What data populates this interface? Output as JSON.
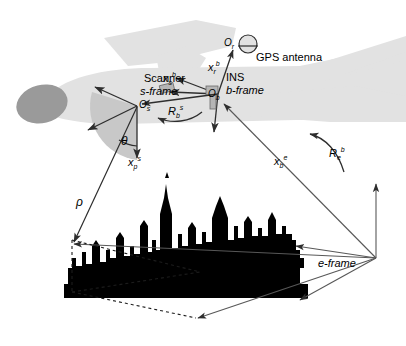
{
  "figure": {
    "background_color": "#ffffff",
    "line_color": "#3a3a3a",
    "text_color": "#000000"
  },
  "aircraft": {
    "body_color": "#e2e2e2",
    "nose_color": "#9a9a9a",
    "name": "aircraft-silhouette"
  },
  "terrain": {
    "skyline_color": "#000000",
    "name": "city-skyline-silhouette"
  },
  "scanner": {
    "wedge_color": "#c8c8c8",
    "label": "Scanner",
    "frame_label": "s-frame",
    "origin_symbol": "O",
    "origin_subscript": "s",
    "angle_symbol": "θ",
    "range_symbol": "ρ"
  },
  "ins": {
    "label": "INS",
    "frame_label": "b-frame",
    "origin_symbol": "O",
    "origin_subscript": "b"
  },
  "gps": {
    "label": "GPS antenna",
    "origin_symbol": "O",
    "origin_subscript": "r"
  },
  "earth": {
    "frame_label": "e-frame"
  },
  "vectors": [
    {
      "name": "scanner-point-vector",
      "base": "x",
      "sub": "p",
      "sup": "s",
      "x": 128,
      "y": 155
    },
    {
      "name": "scanner-lever-arm-vector",
      "base": "x",
      "sub": "s",
      "sup": "b",
      "x": 163,
      "y": 71
    },
    {
      "name": "gps-lever-arm-vector",
      "base": "x",
      "sub": "r",
      "sup": "b",
      "x": 208,
      "y": 60
    },
    {
      "name": "body-position-vector",
      "base": "x",
      "sub": "b",
      "sup": "e",
      "x": 274,
      "y": 154
    }
  ],
  "rotations": [
    {
      "name": "scanner-to-body-rotation",
      "base": "R",
      "sub": "b",
      "sup": "s",
      "x": 168,
      "y": 104
    },
    {
      "name": "body-to-earth-rotation",
      "base": "R",
      "sub": "e",
      "sup": "b",
      "x": 329,
      "y": 146
    }
  ]
}
